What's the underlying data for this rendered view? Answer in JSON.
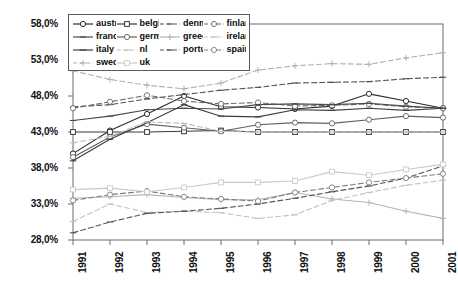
{
  "chart_data": {
    "type": "line",
    "title": "",
    "subtitle": "",
    "xlabel": "",
    "ylabel": "",
    "x": [
      "1991",
      "1992",
      "1993",
      "1994",
      "1995",
      "1996",
      "1997",
      "1998",
      "1999",
      "2000",
      "2001"
    ],
    "categories": [
      "1991",
      "1992",
      "1993",
      "1994",
      "1995",
      "1996",
      "1997",
      "1998",
      "1999",
      "2000",
      "2001"
    ],
    "ylim": [
      28.0,
      58.0
    ],
    "yticks": [
      28.0,
      33.0,
      38.0,
      43.0,
      48.0,
      53.0,
      58.0
    ],
    "ytick_labels": [
      "28,0%",
      "33,0%",
      "38,0%",
      "43,0%",
      "48,0%",
      "53,0%",
      "58,0%"
    ],
    "grid": false,
    "legend_position": "top-left",
    "value_unit": "%",
    "decimal_separator": ",",
    "series": [
      {
        "name": "austria",
        "marker": "circle",
        "dash": "solid",
        "color": "#2b2b2b",
        "values": [
          40.0,
          43.2,
          45.5,
          48.0,
          46.5,
          46.4,
          46.2,
          46.6,
          48.3,
          47.3,
          46.3
        ]
      },
      {
        "name": "belgium",
        "marker": "square",
        "dash": "solid",
        "color": "#3a3a3a",
        "values": [
          43.0,
          43.0,
          43.0,
          43.1,
          43.2,
          43.0,
          43.0,
          43.0,
          43.0,
          43.0,
          43.0
        ]
      },
      {
        "name": "denmark",
        "marker": "dash",
        "dash": "dashed",
        "color": "#555555",
        "values": [
          46.5,
          46.8,
          47.6,
          48.2,
          48.8,
          49.2,
          49.8,
          49.9,
          50.0,
          50.4,
          50.6
        ]
      },
      {
        "name": "finland",
        "marker": "circle-open",
        "dash": "dashed",
        "color": "#6a6a6a",
        "values": [
          46.3,
          47.2,
          48.1,
          47.3,
          46.9,
          47.1,
          46.6,
          46.7,
          46.9,
          46.5,
          46.3
        ]
      },
      {
        "name": "france",
        "marker": "dash",
        "dash": "solid",
        "color": "#4a4a4a",
        "values": [
          44.6,
          45.2,
          46.1,
          46.3,
          46.2,
          46.8,
          46.9,
          46.8,
          47.0,
          46.6,
          46.3
        ]
      },
      {
        "name": "germany",
        "marker": "circle-open",
        "dash": "solid",
        "color": "#5f5f5f",
        "values": [
          39.5,
          42.3,
          44.1,
          43.6,
          43.1,
          44.0,
          44.3,
          44.2,
          44.7,
          45.2,
          45.0
        ]
      },
      {
        "name": "greece",
        "marker": "plus",
        "dash": "solid",
        "color": "#b5b5b5",
        "values": [
          33.8,
          34.0,
          34.3,
          33.9,
          33.6,
          33.6,
          34.6,
          33.7,
          33.2,
          32.0,
          31.0
        ]
      },
      {
        "name": "ireland",
        "marker": "dash",
        "dash": "dashed",
        "color": "#c2c2c2",
        "values": [
          30.6,
          33.0,
          31.8,
          32.0,
          31.8,
          31.0,
          31.5,
          33.5,
          34.6,
          35.6,
          36.3
        ]
      },
      {
        "name": "italy",
        "marker": "dash",
        "dash": "solid",
        "color": "#3f3f3f",
        "values": [
          39.0,
          42.0,
          44.3,
          46.8,
          45.2,
          45.1,
          46.1,
          46.0,
          46.3,
          46.0,
          46.3
        ]
      },
      {
        "name": "nl",
        "marker": "dash",
        "dash": "dashed",
        "color": "#bdbdbd",
        "values": [
          41.5,
          42.4,
          44.4,
          44.2,
          43.1,
          43.0,
          43.0,
          43.0,
          43.0,
          43.0,
          43.0
        ]
      },
      {
        "name": "portugal",
        "marker": "dash",
        "dash": "dashed",
        "color": "#555555",
        "values": [
          29.0,
          30.5,
          31.7,
          32.0,
          32.4,
          33.0,
          33.8,
          34.7,
          35.5,
          36.6,
          38.3
        ]
      },
      {
        "name": "spain",
        "marker": "circle-open",
        "dash": "dashed",
        "color": "#7d7d7d",
        "values": [
          33.5,
          34.3,
          34.8,
          34.0,
          33.7,
          33.4,
          34.6,
          35.3,
          36.0,
          36.6,
          37.2
        ]
      },
      {
        "name": "sweden",
        "marker": "plus",
        "dash": "dashed",
        "color": "#b0b0b0",
        "values": [
          51.5,
          50.3,
          49.5,
          49.0,
          49.8,
          51.6,
          52.2,
          52.5,
          52.4,
          53.3,
          54.0
        ]
      },
      {
        "name": "uk",
        "marker": "square-open",
        "dash": "solid",
        "color": "#c9c9c9",
        "values": [
          35.0,
          35.2,
          34.7,
          35.3,
          36.0,
          36.0,
          36.2,
          37.5,
          37.0,
          37.8,
          38.5
        ]
      }
    ]
  },
  "legend": {
    "items": [
      {
        "label": "austria"
      },
      {
        "label": "belgium"
      },
      {
        "label": "denmark"
      },
      {
        "label": "finland"
      },
      {
        "label": "france"
      },
      {
        "label": "germany"
      },
      {
        "label": "greece"
      },
      {
        "label": "ireland"
      },
      {
        "label": "italy"
      },
      {
        "label": "nl"
      },
      {
        "label": "portugal"
      },
      {
        "label": "spain"
      },
      {
        "label": "sweden"
      },
      {
        "label": "uk"
      }
    ]
  },
  "axes": {
    "y_labels": [
      "58,0%",
      "53,0%",
      "48,0%",
      "43,0%",
      "38,0%",
      "33,0%",
      "28,0%"
    ],
    "x_labels": [
      "1991",
      "1992",
      "1993",
      "1994",
      "1995",
      "1996",
      "1997",
      "1998",
      "1999",
      "2000",
      "2001"
    ]
  },
  "colors": {
    "frame": "#6b6b6b",
    "text": "#111111",
    "background": "#ffffff"
  }
}
